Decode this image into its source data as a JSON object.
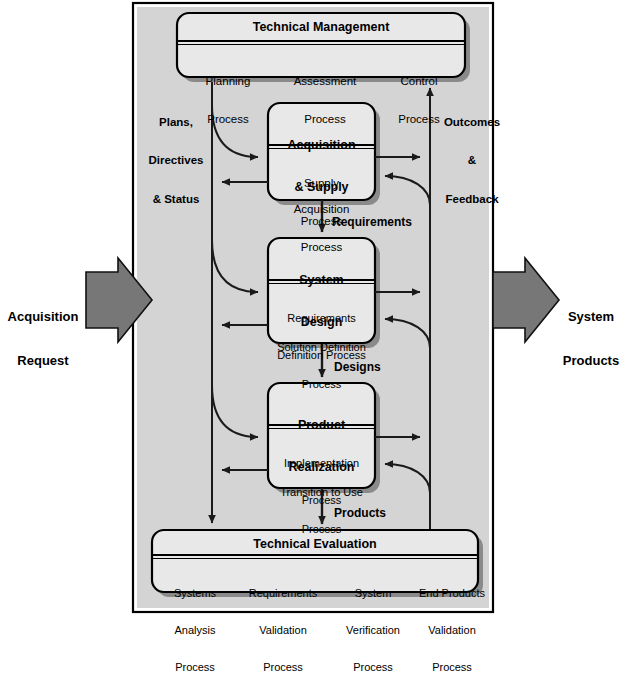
{
  "diagram": {
    "colors": {
      "panel_fill": "#d4d4d4",
      "box_fill": "#e8e8e8",
      "shadow": "#8a8a8a",
      "arrow_fill": "#7a7a7a",
      "line": "#111111",
      "background": "#ffffff"
    }
  },
  "external": {
    "input_label": "Acquisition\nRequest",
    "input_label_line1": "Acquisition",
    "input_label_line2": "Request",
    "output_label_line1": "System",
    "output_label_line2": "Products",
    "input_arrow_icon": "right-arrow-icon",
    "output_arrow_icon": "right-arrow-icon"
  },
  "side_labels": {
    "left_line1": "Plans,",
    "left_line2": "Directives",
    "left_line3": "& Status",
    "right_line1": "Outcomes",
    "right_line2": "&",
    "right_line3": "Feedback"
  },
  "flow_labels": {
    "requirements": "Requirements",
    "designs": "Designs",
    "products": "Products"
  },
  "groups": [
    {
      "id": "technical-management",
      "title": "Technical Management",
      "processes": [
        {
          "line1": "Planning",
          "line2": "Process"
        },
        {
          "line1": "Assessment",
          "line2": "Process"
        },
        {
          "line1": "Control",
          "line2": "Process"
        }
      ]
    },
    {
      "id": "acquisition-and-supply",
      "title_line1": "Acquisition",
      "title_line2": "& Supply",
      "processes": [
        {
          "line1": "Supply",
          "line2": "Process"
        },
        {
          "line1": "Acquisition",
          "line2": "Process"
        }
      ]
    },
    {
      "id": "system-design",
      "title_line1": "System",
      "title_line2": "Design",
      "processes": [
        {
          "line1": "Requirements",
          "line2": "Definition Process"
        },
        {
          "line1": "Solution Definition",
          "line2": "Process"
        }
      ]
    },
    {
      "id": "product-realization",
      "title_line1": "Product",
      "title_line2": "Realization",
      "processes": [
        {
          "line1": "Implementation",
          "line2": "Process"
        },
        {
          "line1": "Transition to Use",
          "line2": "Process"
        }
      ]
    },
    {
      "id": "technical-evaluation",
      "title": "Technical Evaluation",
      "processes": [
        {
          "line1": "Systems",
          "line2": "Analysis",
          "line3": "Process"
        },
        {
          "line1": "Requirements",
          "line2": "Validation",
          "line3": "Process"
        },
        {
          "line1": "System",
          "line2": "Verification",
          "line3": "Process"
        },
        {
          "line1": "End Products",
          "line2": "Validation",
          "line3": "Process"
        }
      ]
    }
  ]
}
